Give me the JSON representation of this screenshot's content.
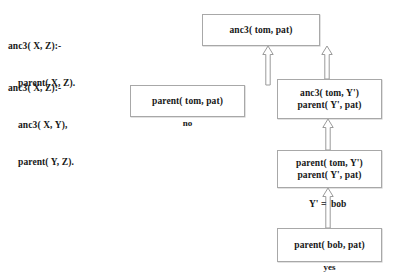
{
  "program": {
    "clause_1": {
      "head": "anc3( X, Z):-",
      "body_1": "parent( X, Z)."
    },
    "clause_2": {
      "head": "anc3( X, Z):-",
      "body_1": "anc3( X, Y),",
      "body_2": "parent( Y, Z)."
    }
  },
  "tree": {
    "root_goal": "anc3( tom, pat)",
    "left_branch": {
      "goal": "parent( tom, pat)",
      "result": "no"
    },
    "right_branch": {
      "goal_line_1": "anc3( tom, Y')",
      "goal_line_2": "parent( Y', pat)"
    },
    "middle_node": {
      "goal_line_1": "parent( tom, Y')",
      "goal_line_2": "parent( Y', pat)"
    },
    "binding": "Y' =  bob",
    "bottom_node": {
      "goal": "parent( bob, pat)",
      "result": "yes"
    }
  },
  "colors": {
    "background": "#ffffff",
    "box_border": "#a8a8a8",
    "text": "#171717",
    "arrow_stroke": "#9a9a9a"
  }
}
